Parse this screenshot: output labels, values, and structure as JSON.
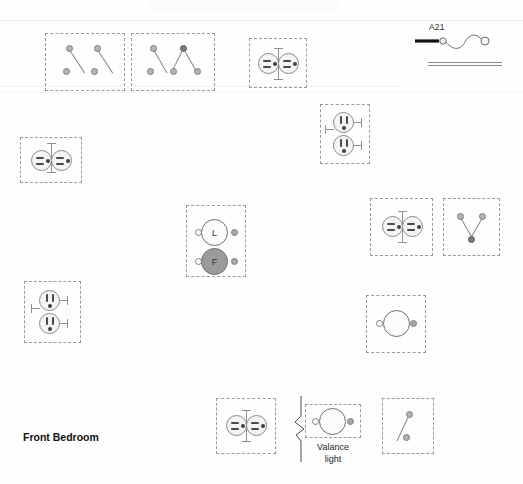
{
  "drawing": {
    "type": "electrical-floor-plan-detail",
    "room_label": "Front Bedroom",
    "legend": {
      "circuit_label": "A21",
      "wire_symbol": "home-run-wire",
      "double_line_symbol": "wall-section"
    },
    "annotations": [
      {
        "id": "valance-light",
        "text_line1": "Valance",
        "text_line2": "light"
      }
    ],
    "colors": {
      "background": "#fefefe",
      "box_outline": "#9a9a9a",
      "symbol_outline": "#8a8a8a",
      "switch_node": "#b4b4b4",
      "switch_node_dark": "#7c7c7c",
      "fan_fill": "#9b9b9b",
      "light_fill": "#fbfbfb",
      "ink": "#111111",
      "slot": "#4a4a4a",
      "tab_right": "#a8a8a8"
    },
    "device_groups": [
      {
        "id": "switch-bank-top-left",
        "box": {
          "x": 45,
          "y": 33,
          "w": 80,
          "h": 58
        },
        "devices": [
          {
            "type": "single-pole-switch",
            "label": "S"
          },
          {
            "type": "single-pole-switch",
            "label": "S"
          }
        ]
      },
      {
        "id": "switch-bank-top-mid",
        "box": {
          "x": 131,
          "y": 33,
          "w": 84,
          "h": 58
        },
        "devices": [
          {
            "type": "single-pole-switch",
            "label": "S"
          },
          {
            "type": "three-way-switch",
            "label": "S3"
          }
        ]
      },
      {
        "id": "receptacle-top",
        "box": {
          "x": 249,
          "y": 38,
          "w": 58,
          "h": 50
        },
        "devices": [
          {
            "type": "duplex-receptacle",
            "orientation": "horizontal"
          }
        ]
      },
      {
        "id": "receptacle-upper-right-pair",
        "box": {
          "x": 320,
          "y": 104,
          "w": 50,
          "h": 60
        },
        "devices": [
          {
            "type": "duplex-receptacle",
            "orientation": "vertical"
          },
          {
            "type": "duplex-receptacle",
            "orientation": "vertical"
          }
        ]
      },
      {
        "id": "receptacle-left",
        "box": {
          "x": 20,
          "y": 137,
          "w": 62,
          "h": 46
        },
        "devices": [
          {
            "type": "duplex-receptacle",
            "orientation": "horizontal"
          }
        ]
      },
      {
        "id": "fixture-group-center",
        "box": {
          "x": 186,
          "y": 205,
          "w": 60,
          "h": 72
        },
        "devices": [
          {
            "type": "light-fixture",
            "label": "L"
          },
          {
            "type": "fan-fixture",
            "label": "F"
          }
        ]
      },
      {
        "id": "receptacle-mid-right",
        "box": {
          "x": 370,
          "y": 198,
          "w": 63,
          "h": 58
        },
        "devices": [
          {
            "type": "duplex-receptacle",
            "orientation": "horizontal"
          }
        ]
      },
      {
        "id": "switch-mid-far-right",
        "box": {
          "x": 443,
          "y": 198,
          "w": 57,
          "h": 58
        },
        "devices": [
          {
            "type": "three-way-switch",
            "label": "S3"
          }
        ]
      },
      {
        "id": "receptacle-lower-left-pair",
        "box": {
          "x": 24,
          "y": 281,
          "w": 57,
          "h": 62
        },
        "devices": [
          {
            "type": "duplex-receptacle",
            "orientation": "vertical"
          },
          {
            "type": "duplex-receptacle",
            "orientation": "vertical"
          }
        ]
      },
      {
        "id": "fixture-lower-right",
        "box": {
          "x": 366,
          "y": 295,
          "w": 60,
          "h": 58
        },
        "devices": [
          {
            "type": "light-fixture",
            "label": ""
          }
        ]
      },
      {
        "id": "receptacle-bottom",
        "box": {
          "x": 216,
          "y": 398,
          "w": 60,
          "h": 56
        },
        "devices": [
          {
            "type": "duplex-receptacle",
            "orientation": "horizontal"
          }
        ]
      },
      {
        "id": "valance-light-fixture",
        "box": {
          "x": 305,
          "y": 404,
          "w": 56,
          "h": 34
        },
        "devices": [
          {
            "type": "light-fixture",
            "label": ""
          }
        ]
      },
      {
        "id": "switch-bottom-right",
        "box": {
          "x": 382,
          "y": 398,
          "w": 52,
          "h": 56
        },
        "devices": [
          {
            "type": "single-pole-switch",
            "label": "S"
          }
        ]
      }
    ]
  }
}
